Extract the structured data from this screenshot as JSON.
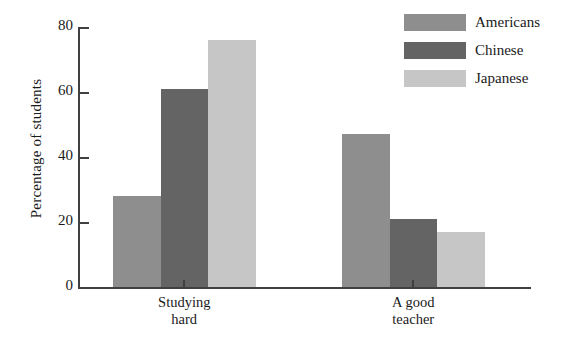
{
  "chart_data": {
    "type": "bar",
    "title": "",
    "xlabel": "",
    "ylabel": "Percentage of students",
    "ylim": [
      0,
      80
    ],
    "yticks": [
      0,
      20,
      40,
      60,
      80
    ],
    "ytick_labels": [
      "0",
      "20",
      "40",
      "60",
      "80"
    ],
    "grid": false,
    "legend_position": "top-right",
    "categories": [
      "Studying\nhard",
      "A good\nteacher"
    ],
    "category_labels_flat": [
      "Studying hard",
      "A good teacher"
    ],
    "series": [
      {
        "name": "Americans",
        "color": "#8e8e8e",
        "values": [
          28,
          47
        ]
      },
      {
        "name": "Chinese",
        "color": "#646464",
        "values": [
          61,
          21
        ]
      },
      {
        "name": "Japanese",
        "color": "#c6c6c6",
        "values": [
          76,
          17
        ]
      }
    ]
  },
  "legend": {
    "items": [
      {
        "label": "Americans",
        "color": "#8e8e8e"
      },
      {
        "label": "Chinese",
        "color": "#646464"
      },
      {
        "label": "Japanese",
        "color": "#c6c6c6"
      }
    ]
  },
  "axes": {
    "y_title": "Percentage of students",
    "y_tick_labels": [
      "80",
      "60",
      "40",
      "20",
      "0"
    ],
    "x_tick_labels": [
      "Studying\nhard",
      "A good\nteacher"
    ]
  },
  "colors": {
    "axis": "#404040",
    "text": "#1a1a1a",
    "background": "#ffffff"
  }
}
